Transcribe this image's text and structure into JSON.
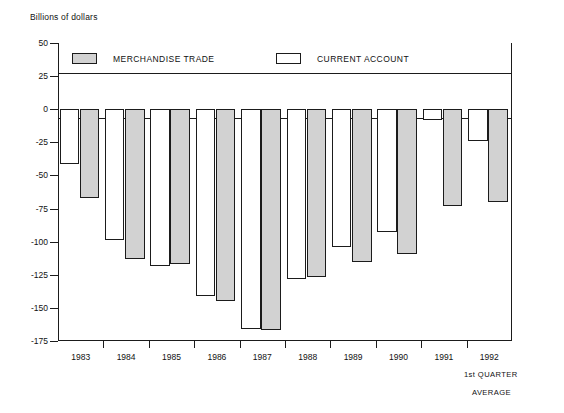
{
  "chart_data": {
    "type": "bar",
    "title": "",
    "axis_title": "Billions of dollars",
    "xlabel": "",
    "ylabel": "Billions of dollars",
    "categories": [
      "1983",
      "1984",
      "1985",
      "1986",
      "1987",
      "1988",
      "1989",
      "1990",
      "1991",
      "1992"
    ],
    "series": [
      {
        "name": "CURRENT ACCOUNT",
        "color": "#ffffff",
        "values": [
          -41,
          -99,
          -118,
          -141,
          -166,
          -128,
          -104,
          -93,
          -8,
          -24
        ]
      },
      {
        "name": "MERCHANDISE TRADE",
        "color": "#d2d2d2",
        "values": [
          -67,
          -113,
          -117,
          -145,
          -167,
          -127,
          -115,
          -109,
          -73,
          -70
        ]
      }
    ],
    "ylim": [
      -175,
      50
    ],
    "yticks": [
      50,
      25,
      0,
      -25,
      -50,
      -75,
      -100,
      -125,
      -150,
      -175
    ],
    "ytick_labels": [
      "50",
      "25",
      "0",
      "-25",
      "-50",
      "-75",
      "-100",
      "-125",
      "-150",
      "-175"
    ],
    "grid": false,
    "legend_position": "top-inside",
    "annotations": [
      "1st QUARTER",
      "AVERAGE"
    ]
  },
  "legend": {
    "entries": [
      {
        "label": "MERCHANDISE TRADE",
        "swatch": "series-merch"
      },
      {
        "label": "CURRENT ACCOUNT",
        "swatch": "series-curr"
      }
    ]
  },
  "notes": {
    "line1": "1st QUARTER",
    "line2": "AVERAGE"
  }
}
